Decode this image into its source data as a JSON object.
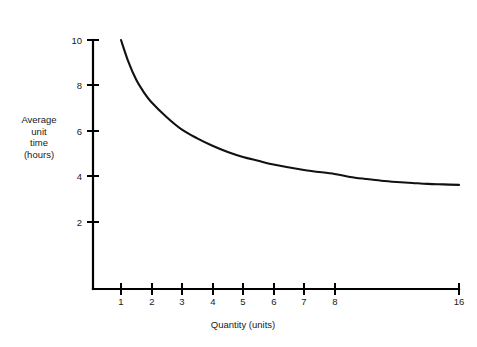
{
  "chart_data": {
    "type": "line",
    "title": "",
    "subtitle": "",
    "xlabel": "Quantity (units)",
    "ylabel": "Average unit time (hours)",
    "ylabel_lines": [
      "Average",
      "unit",
      "time",
      "(hours)"
    ],
    "grid": false,
    "legend": null,
    "legend_position": "none",
    "xlim": [
      0,
      16
    ],
    "ylim": [
      0,
      10
    ],
    "x_scale": "doubling",
    "x_tick_labels": [
      "1",
      "2",
      "3",
      "4",
      "5",
      "6",
      "7",
      "8",
      "16"
    ],
    "x_tick_values": [
      1,
      2,
      3,
      4,
      5,
      6,
      7,
      8,
      16
    ],
    "y_tick_labels": [
      "2",
      "4",
      "6",
      "8",
      "10"
    ],
    "y_tick_values": [
      2,
      4,
      6,
      8,
      10
    ],
    "series": [
      {
        "name": "Average unit time",
        "x": [
          1,
          1.25,
          1.5,
          1.75,
          2,
          2.5,
          3,
          3.5,
          4,
          4.5,
          5,
          5.5,
          6,
          7,
          8,
          9,
          10,
          11,
          12,
          13,
          14,
          15,
          16
        ],
        "values": [
          10.0,
          9.1,
          8.4,
          7.9,
          7.5,
          6.9,
          6.4,
          6.05,
          5.75,
          5.5,
          5.3,
          5.15,
          5.0,
          4.78,
          4.62,
          4.5,
          4.42,
          4.35,
          4.3,
          4.26,
          4.22,
          4.2,
          4.18
        ],
        "color": "#111111"
      }
    ],
    "annotations": [],
    "asymptote": 4.1
  },
  "axes": {
    "y_axis_caption_lines": [
      "Average",
      "unit",
      "time",
      "(hours)"
    ],
    "x_axis_caption": "Quantity (units)"
  },
  "colors": {
    "background": "#ffffff",
    "axis": "#000000",
    "curve": "#111111",
    "text": "#1a1a1a"
  }
}
